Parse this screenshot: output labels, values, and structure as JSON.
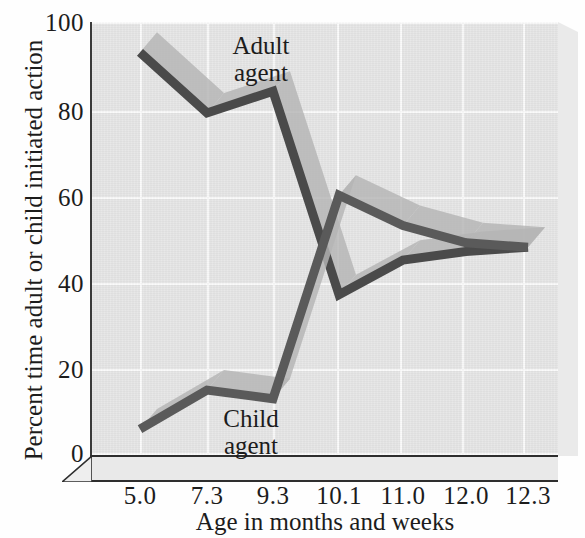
{
  "chart_data": {
    "type": "line",
    "title": "",
    "xlabel": "Age in months and weeks",
    "ylabel": "Percent time adult or child initiated action",
    "categories": [
      "5.0",
      "7.3",
      "9.3",
      "10.1",
      "11.0",
      "12.0",
      "12.3"
    ],
    "ylim": [
      0,
      100
    ],
    "yticks": [
      0,
      20,
      40,
      60,
      80,
      100
    ],
    "ytick_labels": [
      "0",
      "20",
      "40",
      "60",
      "80",
      "100"
    ],
    "grid": true,
    "legend_position": "inline-annotations",
    "style": "3d-ribbon",
    "series": [
      {
        "name": "Adult agent",
        "values": [
          93,
          79,
          84,
          37,
          45,
          47,
          48
        ],
        "line_color": "#4a4a4a",
        "top_face_color": "#b4b4b4"
      },
      {
        "name": "Child agent",
        "values": [
          6,
          15,
          13,
          60,
          53,
          49,
          48
        ],
        "line_color": "#5a5a5a",
        "top_face_color": "#b4b4b4"
      }
    ],
    "annotations": [
      {
        "text": "Adult\nagent",
        "series": "Adult agent"
      },
      {
        "text": "Child\nagent",
        "series": "Child agent"
      }
    ]
  },
  "annotations": {
    "adult_line1": "Adult",
    "adult_line2": "agent",
    "child_line1": "Child",
    "child_line2": "agent"
  },
  "axes": {
    "y_title": "Percent time adult or child initiated action",
    "x_title": "Age in months and weeks"
  },
  "colors": {
    "plot_background": "#e6e6e6",
    "gridline": "#fbfbfb",
    "axis": "#2e2e2e",
    "adult_dark": "#4a4a4a",
    "child_dark": "#5a5a5a",
    "ribbon_top": "#b4b4b4",
    "text": "#1c1c1c"
  }
}
